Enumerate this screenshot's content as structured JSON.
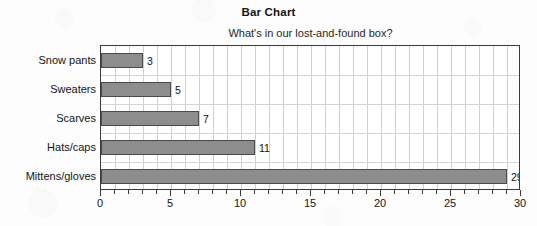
{
  "chart_data": {
    "type": "bar",
    "orientation": "horizontal",
    "title": "Bar Chart",
    "subtitle": "What's in our lost-and-found box?",
    "categories": [
      "Snow pants",
      "Sweaters",
      "Scarves",
      "Hats/caps",
      "Mittens/gloves"
    ],
    "values": [
      3,
      5,
      7,
      11,
      29
    ],
    "value_labels": [
      "3",
      "5",
      "7",
      "11",
      "29"
    ],
    "xlabel": "",
    "ylabel": "",
    "xlim": [
      0,
      30
    ],
    "xticks": [
      0,
      5,
      10,
      15,
      20,
      25,
      30
    ],
    "xtick_labels": [
      "0",
      "5",
      "10",
      "15",
      "20",
      "25",
      "30"
    ],
    "x_minor_tick_step": 1,
    "grid": true,
    "grid_axis": "both",
    "legend": false,
    "bar_color": "#8d8d8d",
    "bar_edge_color": "#4a4a4a",
    "frame_color": "#3b3b3b",
    "grid_color": "#cfcfcf",
    "background_color": "#fdfdfd",
    "plot_background_color": "#ffffff",
    "text_color": "#141414"
  }
}
